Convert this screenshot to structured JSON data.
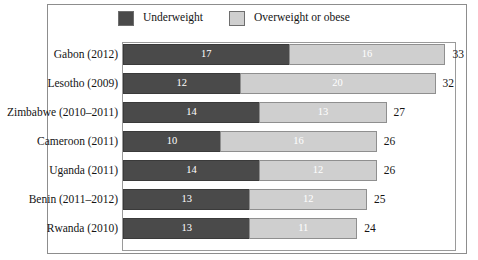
{
  "chart_data": {
    "type": "bar",
    "subtype": "stacked-horizontal",
    "title": "",
    "xlabel": "",
    "ylabel": "",
    "grid": false,
    "legend_position": "top",
    "xlim": [
      0,
      34
    ],
    "categories": [
      "Gabon (2012)",
      "Lesotho (2009)",
      "Zimbabwe (2010–2011)",
      "Cameroon (2011)",
      "Uganda (2011)",
      "Benin (2011–2012)",
      "Rwanda (2010)"
    ],
    "series": [
      {
        "name": "Underweight",
        "color": "#4a4a4a",
        "values": [
          17,
          12,
          14,
          10,
          14,
          13,
          13
        ]
      },
      {
        "name": "Overweight or obese",
        "color": "#cfcfcf",
        "values": [
          16,
          20,
          13,
          16,
          12,
          12,
          11
        ]
      }
    ],
    "totals": [
      33,
      32,
      27,
      26,
      26,
      25,
      24
    ]
  },
  "legend": {
    "items": [
      {
        "label": "Underweight",
        "color": "#4a4a4a"
      },
      {
        "label": "Overweight or obese",
        "color": "#cfcfcf"
      }
    ]
  },
  "rows": [
    {
      "label": "Gabon (2012)",
      "under": 17,
      "over": 16,
      "total": 33
    },
    {
      "label": "Lesotho (2009)",
      "under": 12,
      "over": 20,
      "total": 32
    },
    {
      "label": "Zimbabwe (2010–2011)",
      "under": 14,
      "over": 13,
      "total": 27
    },
    {
      "label": "Cameroon (2011)",
      "under": 10,
      "over": 16,
      "total": 26
    },
    {
      "label": "Uganda (2011)",
      "under": 14,
      "over": 12,
      "total": 26
    },
    {
      "label": "Benin (2011–2012)",
      "under": 13,
      "over": 12,
      "total": 25
    },
    {
      "label": "Rwanda (2010)",
      "under": 13,
      "over": 11,
      "total": 24
    }
  ]
}
